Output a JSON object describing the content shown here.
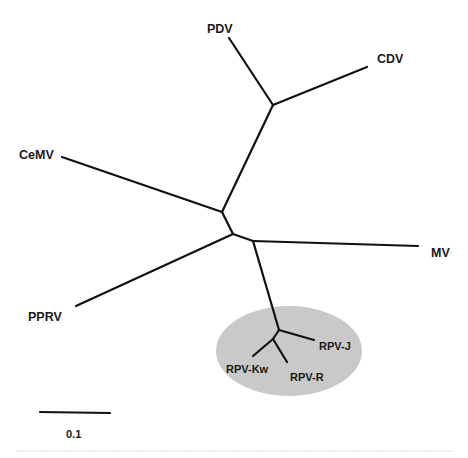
{
  "diagram": {
    "type": "unrooted phylogenetic tree",
    "highlight_color": "#c8c8c8",
    "branch_color": "#111111",
    "taxa": [
      {
        "id": "pdv",
        "label": "PDV"
      },
      {
        "id": "cdv",
        "label": "CDV"
      },
      {
        "id": "cemv",
        "label": "CeMV"
      },
      {
        "id": "mv",
        "label": "MV"
      },
      {
        "id": "pprv",
        "label": "PPRV"
      },
      {
        "id": "rpv_j",
        "label": "RPV-J"
      },
      {
        "id": "rpv_kw",
        "label": "RPV-Kw"
      },
      {
        "id": "rpv_r",
        "label": "RPV-R"
      }
    ],
    "highlighted_clade": [
      "RPV-J",
      "RPV-Kw",
      "RPV-R"
    ],
    "scale_bar": {
      "label": "0.1"
    }
  }
}
